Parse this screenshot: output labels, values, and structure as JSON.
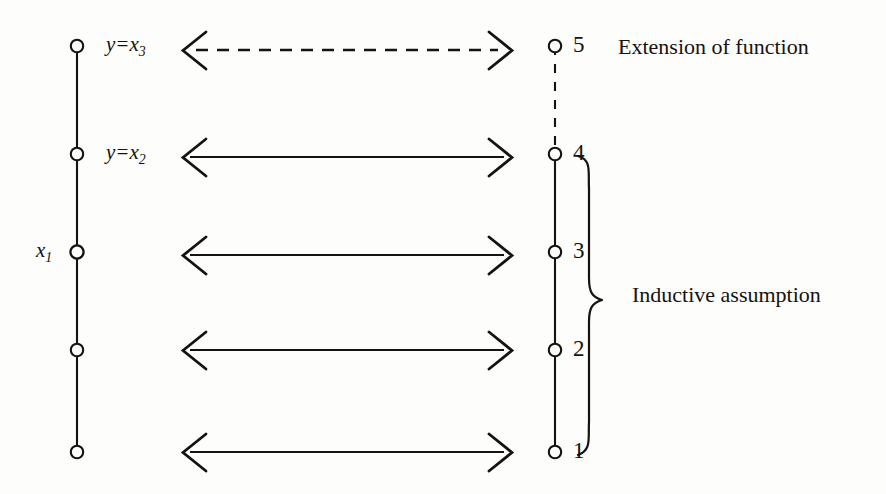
{
  "figure": {
    "background_color": "#fdfdfc",
    "ink_color": "#15120f"
  },
  "left_axis": {
    "name": "left-vertical-line",
    "x": 77,
    "y_top": 46,
    "y_bottom": 452,
    "nodes": [
      {
        "id": "left-node-5",
        "y": 46,
        "label": "y=x",
        "sub": "3",
        "label_side": "right"
      },
      {
        "id": "left-node-4",
        "y": 154,
        "label": "y=x",
        "sub": "2",
        "label_side": "right"
      },
      {
        "id": "left-node-3",
        "y": 252,
        "label": "x",
        "sub": "1",
        "label_side": "left"
      },
      {
        "id": "left-node-2",
        "y": 350,
        "label": "",
        "sub": "",
        "label_side": "none"
      },
      {
        "id": "left-node-1",
        "y": 452,
        "label": "",
        "sub": "",
        "label_side": "none"
      }
    ]
  },
  "right_axis": {
    "name": "right-vertical-line",
    "x": 555,
    "y_top": 46,
    "y_bottom": 452,
    "dashed_segment": {
      "from_y": 46,
      "to_y": 154
    },
    "nodes": [
      {
        "id": "right-node-5",
        "y": 46,
        "label": "5"
      },
      {
        "id": "right-node-4",
        "y": 154,
        "label": "4"
      },
      {
        "id": "right-node-3",
        "y": 252,
        "label": "3"
      },
      {
        "id": "right-node-2",
        "y": 350,
        "label": "2"
      },
      {
        "id": "right-node-1",
        "y": 452,
        "label": "1"
      }
    ]
  },
  "arrows": [
    {
      "id": "arrow-5",
      "y": 50,
      "x_start": 182,
      "x_end": 512,
      "style": "dashed",
      "heads": "both"
    },
    {
      "id": "arrow-4",
      "y": 157,
      "x_start": 182,
      "x_end": 512,
      "style": "solid",
      "heads": "both"
    },
    {
      "id": "arrow-3",
      "y": 255,
      "x_start": 182,
      "x_end": 512,
      "style": "solid",
      "heads": "both"
    },
    {
      "id": "arrow-2",
      "y": 350,
      "x_start": 182,
      "x_end": 512,
      "style": "solid",
      "heads": "both"
    },
    {
      "id": "arrow-1",
      "y": 452,
      "x_start": 182,
      "x_end": 512,
      "style": "solid",
      "heads": "both"
    }
  ],
  "brace": {
    "name": "inductive-assumption-brace",
    "x": 592,
    "y_top": 155,
    "y_bottom": 455,
    "tip_y": 300,
    "orientation": "right-pointing"
  },
  "annotations": [
    {
      "id": "extension-of-function-label",
      "text": "Extension of function",
      "x": 618,
      "y": 36
    },
    {
      "id": "inductive-assumption-label",
      "text": "Inductive assumption",
      "x": 632,
      "y": 284
    }
  ]
}
